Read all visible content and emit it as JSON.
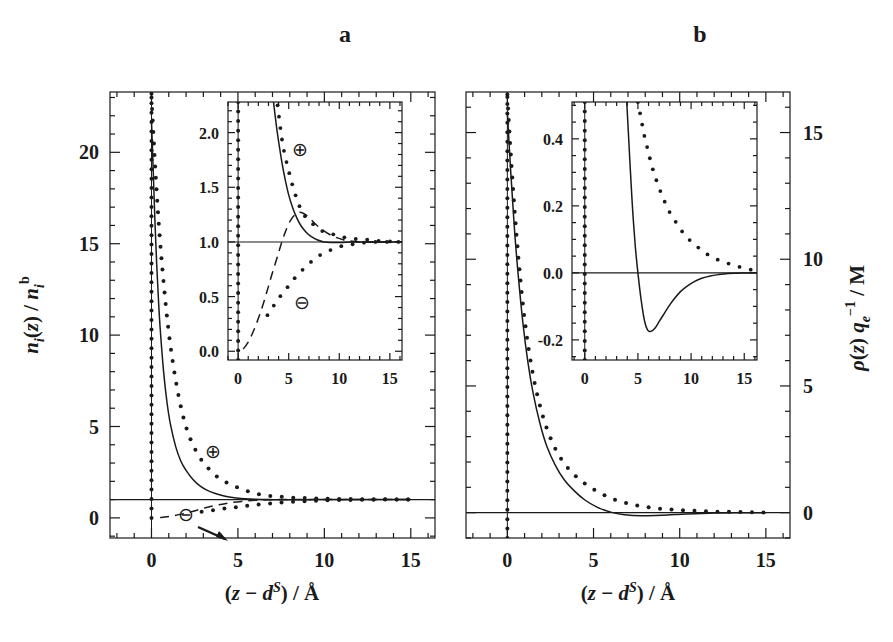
{
  "figure": {
    "width": 893,
    "height": 642,
    "background": "#ffffff",
    "ink": "#1a1a1a"
  },
  "panels": [
    {
      "key": "a",
      "label": "a",
      "label_pos": {
        "x": 345,
        "y": 42
      },
      "frame": {
        "x": 110,
        "y": 92,
        "w": 325,
        "h": 446
      },
      "xlabel": "(z − d S) / Å",
      "ylabel": "n i(z) / n i b",
      "annotations": [
        {
          "text": "⊕",
          "x": 213,
          "y": 452
        },
        {
          "text": "⊖",
          "x": 185,
          "y": 520
        }
      ]
    },
    {
      "key": "b",
      "label": "b",
      "label_pos": {
        "x": 700,
        "y": 42
      },
      "frame": {
        "x": 466,
        "y": 92,
        "w": 324,
        "h": 446
      },
      "xlabel": "(z − d S) / Å",
      "ylabel": "ρ(z) q e −1 / M",
      "annotations": []
    }
  ],
  "chart_data": [
    {
      "id": "panel-a-main",
      "type": "line",
      "title": "a",
      "xlabel": "(z - d^S) / A",
      "ylabel": "n_i(z) / n_i^b",
      "xlim": [
        -2.4,
        16.4
      ],
      "ylim": [
        -1.1,
        23.3
      ],
      "xticks": [
        0,
        5,
        10,
        15
      ],
      "xticklabels": [
        "0",
        "5",
        "10",
        "15"
      ],
      "yticks": [
        0,
        5,
        10,
        15,
        20
      ],
      "yticklabels": [
        "0",
        "5",
        "10",
        "15",
        "20"
      ],
      "xminor_step": 1,
      "yminor_step": 1,
      "grid": false,
      "legend": null,
      "reference_lines": [
        {
          "orientation": "horizontal",
          "value": 1.0,
          "style": "solid"
        },
        {
          "orientation": "vertical",
          "value": 0.0,
          "style": "solid"
        }
      ],
      "series": [
        {
          "name": "cation solid (HNC)",
          "style": "solid",
          "x": [
            0.0,
            0.1,
            0.2,
            0.3,
            0.4,
            0.5,
            0.7,
            0.9,
            1.1,
            1.4,
            1.7,
            2.0,
            2.4,
            2.8,
            3.2,
            3.7,
            4.2,
            4.8,
            5.4,
            6.0,
            6.8,
            7.6,
            8.5,
            9.5,
            10.5,
            12.0,
            13.5,
            15.0
          ],
          "y": [
            21.7,
            19.0,
            16.2,
            13.9,
            12.0,
            10.4,
            8.0,
            6.3,
            5.1,
            3.9,
            3.1,
            2.6,
            2.1,
            1.75,
            1.52,
            1.33,
            1.2,
            1.1,
            1.05,
            1.02,
            1.0,
            0.99,
            0.99,
            1.0,
            1.0,
            1.0,
            1.0,
            1.0
          ]
        },
        {
          "name": "cation dotted (MC)",
          "style": "dotted",
          "x": [
            0.0,
            0.25,
            0.5,
            0.8,
            1.1,
            1.5,
            1.9,
            2.3,
            2.8,
            3.3,
            3.8,
            4.4,
            5.0,
            5.6,
            6.2,
            6.9,
            7.6,
            8.3,
            9.0,
            9.8,
            10.6,
            11.4,
            12.2,
            13.0,
            13.8,
            14.6,
            15.4
          ],
          "y": [
            23.0,
            18.6,
            15.1,
            11.9,
            9.4,
            7.0,
            5.3,
            4.2,
            3.3,
            2.7,
            2.25,
            1.9,
            1.65,
            1.45,
            1.3,
            1.2,
            1.15,
            1.1,
            1.08,
            1.06,
            1.04,
            1.03,
            1.02,
            1.02,
            1.01,
            1.01,
            1.0
          ]
        },
        {
          "name": "anion dashed (HNC)",
          "style": "dashed",
          "x": [
            0.5,
            0.9,
            1.3,
            1.8,
            2.3,
            2.8,
            3.3,
            3.9,
            4.5,
            5.2,
            6.0,
            6.8,
            7.8,
            9.0,
            10.4,
            12.0,
            13.5,
            15.0
          ],
          "y": [
            0.02,
            0.06,
            0.12,
            0.22,
            0.34,
            0.47,
            0.6,
            0.72,
            0.82,
            0.9,
            0.96,
            0.99,
            1.01,
            1.01,
            1.0,
            1.0,
            1.0,
            1.0
          ]
        },
        {
          "name": "anion dotted (MC)",
          "style": "dotted",
          "x": [
            2.9,
            3.4,
            3.9,
            4.4,
            5.0,
            5.6,
            6.2,
            6.9,
            7.6,
            8.3,
            9.0,
            9.8,
            10.6,
            11.4,
            12.2,
            13.0,
            13.8,
            14.6,
            15.4
          ],
          "y": [
            0.33,
            0.4,
            0.47,
            0.53,
            0.6,
            0.67,
            0.73,
            0.79,
            0.85,
            0.89,
            0.92,
            0.95,
            0.97,
            0.98,
            0.99,
            1.0,
            1.0,
            1.0,
            1.0
          ]
        }
      ],
      "arrow_annotations": [
        {
          "label": "⊖",
          "from": [
            2.0,
            2.3
          ],
          "to": [
            3.1,
            0.85
          ]
        }
      ]
    },
    {
      "id": "panel-a-inset",
      "type": "line",
      "parent": "panel-a-main",
      "frame": {
        "x": 228,
        "y": 102,
        "w": 174,
        "h": 258
      },
      "xlabel": "",
      "ylabel": "",
      "xlim": [
        -1.0,
        16.2
      ],
      "ylim": [
        -0.08,
        2.28
      ],
      "xticks": [
        0,
        5,
        10,
        15
      ],
      "xticklabels": [
        "0",
        "5",
        "10",
        "15"
      ],
      "yticks": [
        0.0,
        0.5,
        1.0,
        1.5,
        2.0
      ],
      "yticklabels": [
        "0.0",
        "0.5",
        "1.0",
        "1.5",
        "2.0"
      ],
      "xminor_step": 1,
      "yminor_step": 0.1,
      "grid": false,
      "reference_lines": [
        {
          "orientation": "horizontal",
          "value": 1.0,
          "style": "solid"
        },
        {
          "orientation": "vertical",
          "value": 0.0,
          "style": "solid"
        }
      ],
      "annotations": [
        {
          "text": "⊕",
          "x": 6.1,
          "y": 1.85
        },
        {
          "text": "⊖",
          "x": 6.3,
          "y": 0.45
        }
      ],
      "series": [
        {
          "name": "cation solid (HNC)",
          "style": "solid",
          "x": [
            3.5,
            3.8,
            4.1,
            4.4,
            4.7,
            5.0,
            5.4,
            5.8,
            6.2,
            6.7,
            7.2,
            7.8,
            8.5,
            9.3,
            10.2,
            11.2,
            12.3,
            13.5,
            15.0,
            16.2
          ],
          "y": [
            2.28,
            2.05,
            1.86,
            1.69,
            1.55,
            1.43,
            1.31,
            1.22,
            1.15,
            1.09,
            1.05,
            1.02,
            1.0,
            0.995,
            0.995,
            1.0,
            1.0,
            1.0,
            1.0,
            1.0
          ]
        },
        {
          "name": "cation dotted (MC)",
          "style": "dotted",
          "x": [
            3.9,
            4.4,
            5.0,
            5.6,
            6.2,
            6.9,
            7.6,
            8.3,
            9.0,
            9.8,
            10.6,
            11.4,
            12.2,
            13.0,
            13.8,
            14.6,
            15.4,
            16.1
          ],
          "y": [
            2.25,
            1.9,
            1.65,
            1.45,
            1.3,
            1.2,
            1.15,
            1.1,
            1.08,
            1.06,
            1.04,
            1.03,
            1.02,
            1.02,
            1.01,
            1.01,
            1.0,
            1.0
          ]
        },
        {
          "name": "anion dashed (HNC)",
          "style": "dashed",
          "x": [
            0.5,
            0.9,
            1.3,
            1.8,
            2.3,
            2.8,
            3.3,
            3.9,
            4.5,
            5.2,
            6.0,
            6.8,
            7.8,
            9.0,
            10.4,
            12.0,
            13.5,
            15.0,
            16.2
          ],
          "y": [
            0.02,
            0.07,
            0.14,
            0.25,
            0.38,
            0.53,
            0.69,
            0.87,
            1.05,
            1.2,
            1.27,
            1.24,
            1.15,
            1.07,
            1.02,
            1.0,
            1.0,
            1.0,
            1.0
          ]
        },
        {
          "name": "anion dotted (MC)",
          "style": "dotted",
          "x": [
            2.9,
            3.4,
            3.9,
            4.4,
            5.0,
            5.6,
            6.2,
            6.9,
            7.6,
            8.3,
            9.0,
            9.8,
            10.6,
            11.4,
            12.2,
            13.0,
            13.8,
            14.6,
            15.4,
            16.1
          ],
          "y": [
            0.33,
            0.4,
            0.47,
            0.53,
            0.6,
            0.67,
            0.73,
            0.79,
            0.85,
            0.89,
            0.92,
            0.95,
            0.97,
            0.98,
            0.99,
            1.0,
            1.0,
            1.0,
            1.0,
            1.0
          ]
        }
      ]
    },
    {
      "id": "panel-b-main",
      "type": "line",
      "title": "b",
      "xlabel": "(z - d^S) / A",
      "ylabel": "rho(z) q_e^-1 / M",
      "xlim": [
        -2.4,
        16.4
      ],
      "ylim": [
        -1.0,
        16.6
      ],
      "xticks": [
        0,
        5,
        10,
        15
      ],
      "xticklabels": [
        "0",
        "5",
        "10",
        "15"
      ],
      "yticks": [
        0,
        5,
        10,
        15
      ],
      "yticklabels": [
        "0",
        "5",
        "10",
        "15"
      ],
      "xminor_step": 1,
      "yminor_step": 1,
      "grid": false,
      "reference_lines": [
        {
          "orientation": "horizontal",
          "value": 0.0,
          "style": "solid"
        },
        {
          "orientation": "vertical",
          "value": 0.0,
          "style": "solid"
        }
      ],
      "series": [
        {
          "name": "charge density solid (HNC)",
          "style": "solid",
          "x": [
            0.0,
            0.2,
            0.4,
            0.6,
            0.9,
            1.2,
            1.5,
            1.9,
            2.3,
            2.8,
            3.3,
            3.9,
            4.5,
            5.2,
            6.0,
            6.8,
            7.8,
            9.0,
            10.4,
            12.0,
            13.5,
            15.0
          ],
          "y": [
            15.8,
            13.4,
            11.3,
            9.6,
            7.5,
            5.9,
            4.7,
            3.5,
            2.6,
            1.85,
            1.3,
            0.85,
            0.5,
            0.22,
            0.02,
            -0.08,
            -0.12,
            -0.1,
            -0.05,
            -0.01,
            0.0,
            0.0
          ]
        },
        {
          "name": "charge density dotted (MC)",
          "style": "dotted",
          "x": [
            0.0,
            0.25,
            0.5,
            0.8,
            1.1,
            1.5,
            1.9,
            2.3,
            2.8,
            3.3,
            3.8,
            4.4,
            5.0,
            5.6,
            6.2,
            6.9,
            7.6,
            8.3,
            9.0,
            9.8,
            10.6,
            11.4,
            12.2,
            13.0,
            13.8,
            14.6,
            15.4
          ],
          "y": [
            16.4,
            13.6,
            11.2,
            8.9,
            7.1,
            5.4,
            4.2,
            3.3,
            2.5,
            1.95,
            1.55,
            1.2,
            0.92,
            0.7,
            0.52,
            0.38,
            0.27,
            0.2,
            0.15,
            0.11,
            0.08,
            0.06,
            0.04,
            0.03,
            0.02,
            0.01,
            0.01
          ]
        }
      ]
    },
    {
      "id": "panel-b-inset",
      "type": "line",
      "parent": "panel-b-main",
      "frame": {
        "x": 572,
        "y": 102,
        "w": 185,
        "h": 258
      },
      "xlabel": "",
      "ylabel": "",
      "xlim": [
        -1.2,
        16.2
      ],
      "ylim": [
        -0.26,
        0.51
      ],
      "xticks": [
        0,
        5,
        10,
        15
      ],
      "xticklabels": [
        "0",
        "5",
        "10",
        "15"
      ],
      "yticks": [
        -0.2,
        0.0,
        0.2,
        0.4
      ],
      "yticklabels": [
        "-0.2",
        "0.0",
        "0.2",
        "0.4"
      ],
      "xminor_step": 1,
      "yminor_step": 0.05,
      "grid": false,
      "reference_lines": [
        {
          "orientation": "horizontal",
          "value": 0.0,
          "style": "solid"
        },
        {
          "orientation": "vertical",
          "value": 0.0,
          "style": "solid"
        }
      ],
      "series": [
        {
          "name": "charge density solid (HNC)",
          "style": "solid",
          "x": [
            3.95,
            4.1,
            4.3,
            4.5,
            4.75,
            5.0,
            5.3,
            5.6,
            5.9,
            6.2,
            6.6,
            7.0,
            7.4,
            7.9,
            8.4,
            9.0,
            9.6,
            10.3,
            11.0,
            11.8,
            12.6,
            13.5,
            14.4,
            15.4,
            16.2
          ],
          "y": [
            0.51,
            0.42,
            0.3,
            0.19,
            0.08,
            0.0,
            -0.08,
            -0.14,
            -0.17,
            -0.175,
            -0.165,
            -0.145,
            -0.125,
            -0.1,
            -0.078,
            -0.056,
            -0.04,
            -0.026,
            -0.016,
            -0.009,
            -0.005,
            -0.002,
            -0.001,
            0.0,
            0.0
          ]
        },
        {
          "name": "charge density dotted (MC)",
          "style": "dotted",
          "x": [
            5.0,
            5.3,
            5.6,
            5.95,
            6.3,
            6.7,
            7.1,
            7.55,
            8.0,
            8.5,
            9.0,
            9.55,
            10.1,
            10.7,
            11.3,
            11.95,
            12.6,
            13.3,
            14.0,
            14.75,
            15.5,
            16.1
          ],
          "y": [
            0.51,
            0.46,
            0.41,
            0.365,
            0.32,
            0.28,
            0.245,
            0.21,
            0.18,
            0.155,
            0.13,
            0.11,
            0.09,
            0.075,
            0.06,
            0.048,
            0.038,
            0.03,
            0.023,
            0.016,
            0.01,
            0.008
          ]
        }
      ]
    },
    {
      "id": "panel-a-contact-spike",
      "type": "scatter",
      "parent": "panel-a-main",
      "description": "vertical column of dots at z=0 representing the contact density spike",
      "x": 0.0,
      "y_from": 0.0,
      "y_to": 23.2
    }
  ]
}
